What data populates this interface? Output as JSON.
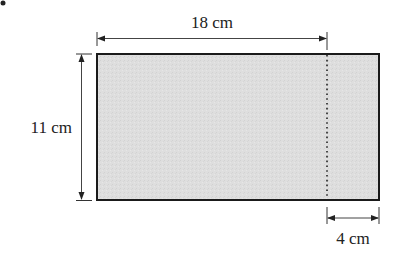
{
  "figure": {
    "type": "rectangle-with-dimensions",
    "fill_color": "#dcdcdc",
    "stroke_color": "#1a1a1a",
    "labels": {
      "width": "18 cm",
      "height": "11 cm",
      "strip": "4 cm"
    },
    "bullet": "•"
  }
}
